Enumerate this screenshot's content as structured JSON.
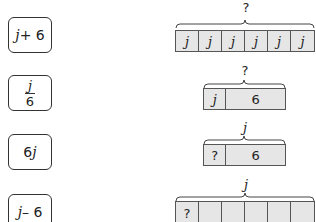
{
  "expressions": [
    {
      "id": "j-plus-6",
      "parts": [
        "j",
        " + 6"
      ]
    },
    {
      "id": "j-over-6",
      "numerator": "j",
      "denominator": "6"
    },
    {
      "id": "6j",
      "parts": [
        "6",
        "j"
      ]
    },
    {
      "id": "j-minus-6",
      "parts": [
        "j",
        " – 6"
      ]
    }
  ],
  "diagrams": [
    {
      "label": "?",
      "cells": [
        "j",
        "j",
        "j",
        "j",
        "j",
        "j"
      ]
    },
    {
      "label": "?",
      "cells": [
        "j",
        "6"
      ]
    },
    {
      "label": "j",
      "cells": [
        "?",
        "6"
      ]
    },
    {
      "label": "j",
      "cells": [
        "?",
        "",
        "",
        "",
        "",
        ""
      ]
    }
  ],
  "colors": {
    "cell_fill": "#e6e6e6",
    "border": "#333333"
  }
}
